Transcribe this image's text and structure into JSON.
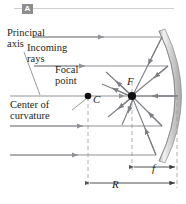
{
  "figure": {
    "panel_label": "A",
    "title_alt": "Concave spherical mirror: parallel rays converge at the focal point",
    "background": "#ffffff",
    "ray_color": "#8f9196",
    "mirror_color": "#d9d9d9",
    "mirror_edge_color": "#8e8e8e",
    "text_color": "#231f20",
    "dash_color": "#9a9a9a"
  },
  "labels": {
    "principal": "Principal",
    "axis": "axis",
    "incoming": "Incoming",
    "rays": "rays",
    "focal": "Focal",
    "point": "point",
    "center": "Center of",
    "curvature": "curvature",
    "focal_point_symbol": "F",
    "center_symbol": "C",
    "radius_symbol": "R",
    "focal_length_symbol": "f"
  },
  "geometry": {
    "axis_y": 96,
    "focal_point": {
      "x": 132,
      "y": 96
    },
    "center_of_curvature": {
      "x": 88,
      "y": 96
    },
    "mirror_vertex": {
      "x": 177,
      "y": 96
    },
    "mirror_top_end": {
      "x": 159,
      "y": 31
    },
    "mirror_bottom_end": {
      "x": 159,
      "y": 161
    },
    "incoming_ray_y_values": [
      37,
      66,
      96,
      126,
      155
    ],
    "radius_span": {
      "from_x": 88,
      "to_x": 177,
      "y": 183
    },
    "focal_span": {
      "from_x": 132,
      "to_x": 177,
      "y": 167
    }
  }
}
